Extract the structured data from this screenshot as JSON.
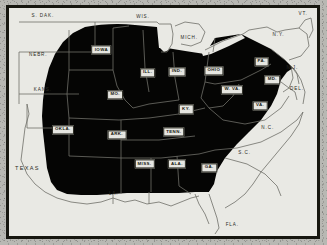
{
  "figure": {
    "kind": "thematic-map",
    "region": "Eastern and Central United States",
    "frame_color": "#16160f",
    "paper_color": "#b8b8b3",
    "land_color": "#e9e9e4",
    "shaded_color": "#050504",
    "border_line_color": "#6f6f68"
  },
  "legend_values": {
    "shaded_meaning": "shaded region",
    "unshaded_meaning": "unshaded region"
  },
  "labels": {
    "shaded": [
      {
        "name": "IOWA",
        "x": 30.0,
        "y": 18.5
      },
      {
        "name": "ILL.",
        "x": 45.0,
        "y": 28.5
      },
      {
        "name": "IND.",
        "x": 54.5,
        "y": 28.0
      },
      {
        "name": "OHIO",
        "x": 66.5,
        "y": 27.5
      },
      {
        "name": "PA.",
        "x": 82.0,
        "y": 23.5
      },
      {
        "name": "MO.",
        "x": 34.5,
        "y": 38.0
      },
      {
        "name": "W. VA.",
        "x": 72.5,
        "y": 36.0
      },
      {
        "name": "MD.",
        "x": 85.5,
        "y": 31.5
      },
      {
        "name": "VA.",
        "x": 81.5,
        "y": 43.0
      },
      {
        "name": "KY.",
        "x": 57.5,
        "y": 44.5
      },
      {
        "name": "ARK.",
        "x": 35.0,
        "y": 55.5
      },
      {
        "name": "TENN.",
        "x": 53.5,
        "y": 54.5
      },
      {
        "name": "MISS.",
        "x": 44.0,
        "y": 68.5
      },
      {
        "name": "ALA.",
        "x": 54.5,
        "y": 68.5
      },
      {
        "name": "GA.",
        "x": 65.0,
        "y": 70.0
      },
      {
        "name": "OKLA.",
        "x": 17.5,
        "y": 53.5
      }
    ],
    "unshaded": [
      {
        "name": "S. DAK.",
        "x": 11.0,
        "y": 3.5,
        "size": "small"
      },
      {
        "name": "WIS.",
        "x": 43.5,
        "y": 4.0,
        "size": "small"
      },
      {
        "name": "MICH.",
        "x": 58.5,
        "y": 13.0,
        "size": "small"
      },
      {
        "name": "N.Y.",
        "x": 87.5,
        "y": 12.0,
        "size": "small"
      },
      {
        "name": "VT.",
        "x": 95.5,
        "y": 2.5,
        "size": "small"
      },
      {
        "name": "NEBR.",
        "x": 9.5,
        "y": 20.5,
        "size": "small"
      },
      {
        "name": "KANS.",
        "x": 11.0,
        "y": 36.0,
        "size": "small"
      },
      {
        "name": "TEXAS",
        "x": 6.0,
        "y": 70.5,
        "size": "big"
      },
      {
        "name": "LA.",
        "x": 34.0,
        "y": 81.5,
        "size": "small"
      },
      {
        "name": "N.C.",
        "x": 84.0,
        "y": 52.5,
        "size": "small"
      },
      {
        "name": "S.C.",
        "x": 76.5,
        "y": 63.5,
        "size": "small"
      },
      {
        "name": "FLA.",
        "x": 72.5,
        "y": 95.0,
        "size": "small"
      },
      {
        "name": "N.J.",
        "x": 92.0,
        "y": 26.5,
        "size": "small"
      },
      {
        "name": "DEL.",
        "x": 93.5,
        "y": 35.5,
        "size": "small"
      }
    ]
  }
}
